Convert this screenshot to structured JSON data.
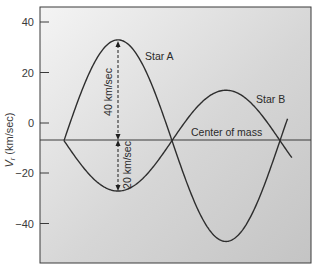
{
  "chart_data": {
    "type": "line",
    "title": "",
    "xlabel": "",
    "ylabel": "V_r (km/sec)",
    "ylabel_main": "V",
    "ylabel_sub": "r",
    "ylabel_unit": " (km/sec)",
    "ylim": [
      -55,
      46
    ],
    "yticks": [
      40,
      20,
      0,
      -20,
      -40
    ],
    "ytick_labels": [
      "40",
      "20",
      "0",
      "−20",
      "−40"
    ],
    "grid": false,
    "legend": "none (curves labeled inline)",
    "center_of_mass_velocity": -7,
    "series": [
      {
        "name": "Star A",
        "description": "Sinusoidal radial velocity curve, amplitude 40 km/sec about center of mass",
        "x": [
          0.0,
          0.25,
          0.5,
          0.75,
          1.0
        ],
        "values": [
          -7,
          33,
          -7,
          -47,
          -7
        ]
      },
      {
        "name": "Star B",
        "description": "Sinusoidal radial velocity curve, amplitude 20 km/sec, opposite phase to Star A",
        "x": [
          0.0,
          0.25,
          0.5,
          0.75,
          1.0
        ],
        "values": [
          -7,
          -27,
          -7,
          13,
          -7
        ]
      }
    ],
    "annotations": [
      {
        "text": "Star A",
        "position": "upper middle-left"
      },
      {
        "text": "Star B",
        "position": "right, near peak of Star B"
      },
      {
        "text": "Center of mass",
        "position": "above horizontal line at V_r ≈ -7"
      },
      {
        "text": "40 km/sec",
        "type": "dashed double arrow",
        "from": -7,
        "to": 33
      },
      {
        "text": "20 km/sec",
        "type": "dashed double arrow",
        "from": -7,
        "to": -27
      }
    ]
  },
  "labels": {
    "star_a": "Star A",
    "star_b": "Star B",
    "center_of_mass": "Center of mass",
    "amp_a": "40 km/sec",
    "amp_b": "20 km/sec",
    "y_main": "V",
    "y_sub": "r",
    "y_unit": " (km/sec)",
    "tick_40": "40",
    "tick_20": "20",
    "tick_0": "0",
    "tick_m20": "−20",
    "tick_m40": "−40"
  },
  "colors": {
    "plot_bg_top": "#f2f2f2",
    "plot_bg_bottom": "#c8c8c8",
    "curve": "#2e2e2e",
    "frame": "#3a3a3a"
  }
}
